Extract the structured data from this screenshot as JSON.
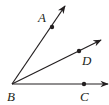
{
  "diagram": {
    "type": "geometry-angles",
    "stroke_color": "#231f20",
    "vertex": {
      "label": "B",
      "x": 12,
      "y": 84,
      "label_x": 7,
      "label_y": 101
    },
    "rays": [
      {
        "name": "BA",
        "end_x": 65,
        "end_y": 6,
        "point": {
          "label": "A",
          "x": 52,
          "y": 27,
          "label_x": 38,
          "label_y": 22
        }
      },
      {
        "name": "BD",
        "end_x": 101,
        "end_y": 40,
        "point": {
          "label": "D",
          "x": 79,
          "y": 51,
          "label_x": 82,
          "label_y": 65
        }
      },
      {
        "name": "BC",
        "end_x": 108,
        "end_y": 84,
        "point": {
          "label": "C",
          "x": 84,
          "y": 84,
          "label_x": 80,
          "label_y": 101
        }
      }
    ]
  }
}
